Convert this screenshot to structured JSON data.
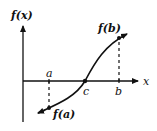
{
  "diagram": {
    "y_axis_label": "f(x)",
    "x_axis_label": "x",
    "points": {
      "a": "a",
      "b": "b",
      "c": "c",
      "fa": "f(a)",
      "fb": "f(b)"
    },
    "colors": {
      "ink": "#111111",
      "background": "#ffffff"
    }
  }
}
